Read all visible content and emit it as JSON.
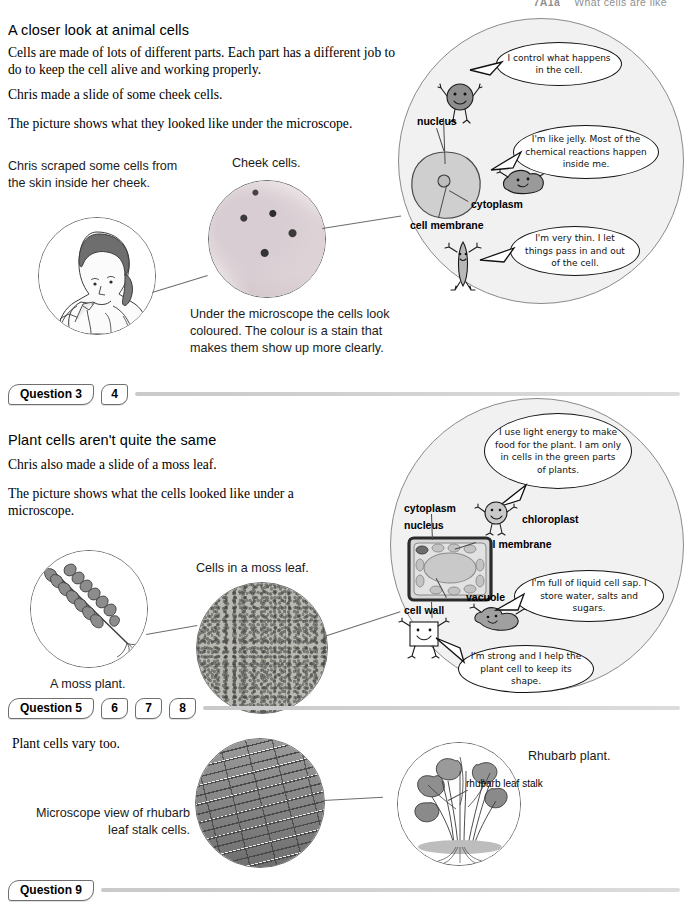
{
  "header": {
    "code": "7A1a",
    "title": "What cells are like"
  },
  "section1": {
    "heading": "A closer look at animal cells",
    "paragraphs": [
      "Cells are made of lots of different parts. Each part has a different job to do to keep the cell alive and working properly.",
      "Chris made a slide of some cheek cells.",
      "The picture shows what they looked like under the microscope."
    ],
    "scrape_caption": "Chris scraped some cells from the skin inside her cheek.",
    "cheek_caption": "Cheek cells.",
    "stain_caption": "Under the microscope the cells look coloured. The colour is a stain that makes them show up more clearly.",
    "diagram": {
      "labels": [
        "nucleus",
        "cytoplasm",
        "cell membrane"
      ],
      "bubbles": [
        "I control what happens in the cell.",
        "I'm like jelly. Most of the chemical reactions happen inside me.",
        "I'm very thin. I let things pass in and out of the cell."
      ]
    }
  },
  "qbar1": {
    "main": "Question 3",
    "numbers": [
      "4"
    ]
  },
  "section2": {
    "heading": "Plant cells aren't quite the same",
    "paragraphs": [
      "Chris also made a slide of a moss leaf.",
      "The picture shows what the cells looked like under a microscope."
    ],
    "moss_plant_caption": "A moss plant.",
    "moss_cells_caption": "Cells in a moss leaf.",
    "diagram": {
      "labels": [
        "cytoplasm",
        "nucleus",
        "chloroplast",
        "cell membrane",
        "vacuole",
        "cell wall"
      ],
      "bubbles": [
        "I use light energy to make food for the plant. I am only in cells in the green parts of plants.",
        "I'm full of liquid cell sap. I store water, salts and sugars.",
        "I'm strong and I help the plant cell to keep its shape."
      ]
    }
  },
  "qbar2": {
    "main": "Question 5",
    "numbers": [
      "6",
      "7",
      "8"
    ]
  },
  "section3": {
    "intro": "Plant cells vary too.",
    "microscope_caption": "Microscope view of rhubarb leaf stalk cells.",
    "rhubarb_caption": "Rhubarb plant.",
    "rhubarb_label": "rhubarb leaf stalk"
  },
  "qbar3": {
    "main": "Question 9",
    "numbers": []
  }
}
